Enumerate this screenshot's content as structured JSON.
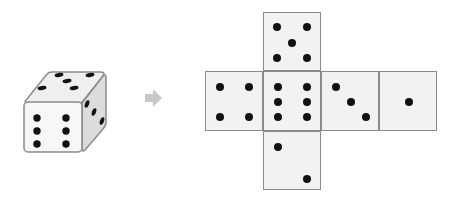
{
  "figure": {
    "colors": {
      "face_fill": "#f2f2f2",
      "face_border": "#8a8a8a",
      "pip": "#111111",
      "arrow": "#c8c8c8"
    }
  },
  "die": {
    "front_face_value": 6,
    "top_face_value": 5,
    "right_face_value": 3
  },
  "arrow": {
    "icon": "right-arrow-icon"
  },
  "net": {
    "faces": [
      {
        "id": "top",
        "value": 5,
        "x": 263,
        "y": 12,
        "w": 58,
        "h": 59,
        "pips": [
          [
            13,
            14
          ],
          [
            43,
            14
          ],
          [
            28,
            30
          ],
          [
            13,
            45
          ],
          [
            43,
            45
          ]
        ]
      },
      {
        "id": "left",
        "value": 4,
        "x": 205,
        "y": 71,
        "w": 58,
        "h": 60,
        "pips": [
          [
            14,
            15
          ],
          [
            43,
            15
          ],
          [
            14,
            45
          ],
          [
            43,
            45
          ]
        ]
      },
      {
        "id": "center",
        "value": 6,
        "x": 263,
        "y": 71,
        "w": 58,
        "h": 60,
        "pips": [
          [
            14,
            15
          ],
          [
            43,
            15
          ],
          [
            14,
            30
          ],
          [
            43,
            30
          ],
          [
            14,
            45
          ],
          [
            43,
            45
          ]
        ]
      },
      {
        "id": "right",
        "value": 3,
        "x": 321,
        "y": 71,
        "w": 58,
        "h": 60,
        "pips": [
          [
            14,
            15
          ],
          [
            29,
            30
          ],
          [
            44,
            45
          ]
        ]
      },
      {
        "id": "far-right",
        "value": 1,
        "x": 379,
        "y": 71,
        "w": 58,
        "h": 60,
        "pips": [
          [
            29,
            30
          ]
        ]
      },
      {
        "id": "bottom",
        "value": 2,
        "x": 263,
        "y": 131,
        "w": 58,
        "h": 59,
        "pips": [
          [
            14,
            15
          ],
          [
            43,
            47
          ]
        ]
      }
    ]
  }
}
